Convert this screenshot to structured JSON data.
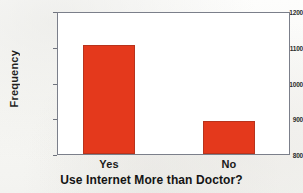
{
  "chart_data": {
    "type": "bar",
    "title": "",
    "categories": [
      "Yes",
      "No"
    ],
    "values": [
      1110,
      895
    ],
    "xlabel": "Use Internet More than Doctor?",
    "ylabel": "Frequency",
    "ylim": [
      800,
      1200
    ],
    "yticks": [
      "800",
      "900",
      "1000",
      "1100",
      "1200"
    ],
    "ytick_values": [
      800,
      900,
      1000,
      1100,
      1200
    ],
    "grid": false,
    "legend": null,
    "bar_color": "#e4391c",
    "bar_edge_color": "#b8331c",
    "frame_color": "#7b7f8a",
    "background_color": "#ffffff"
  }
}
